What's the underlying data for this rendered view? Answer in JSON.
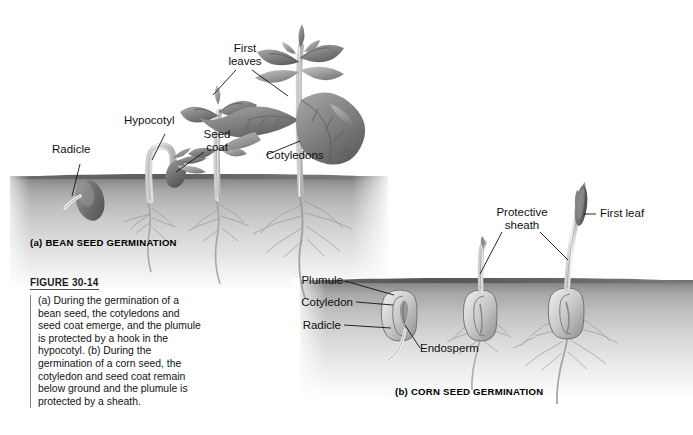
{
  "figure": {
    "number_label": "FIGURE 30-14",
    "caption": "(a) During the germination of a bean seed, the cotyledons and seed coat emerge, and the plumule is protected by a hook in the hypocotyl. (b) During the germination of a corn seed, the cotyledon and seed coat remain below ground and the plumule is protected by a sheath."
  },
  "panel_a": {
    "caption": "(a) BEAN SEED GERMINATION",
    "labels": {
      "radicle": "Radicle",
      "hypocotyl": "Hypocotyl",
      "seed_coat": "Seed\ncoat",
      "first_leaves": "First\nleaves",
      "cotyledons": "Cotyledons"
    }
  },
  "panel_b": {
    "caption": "(b) CORN SEED GERMINATION",
    "labels": {
      "plumule": "Plumule",
      "cotyledon": "Cotyledon",
      "radicle": "Radicle",
      "endosperm": "Endosperm",
      "protective_sheath": "Protective\nsheath",
      "first_leaf": "First leaf"
    }
  },
  "colors": {
    "background": "#ffffff",
    "soil_dark": "#6e6e6e",
    "soil_light": "#ffffff",
    "leader_line": "#1a1a1a",
    "text": "#111111",
    "rule": "#8a8a8a"
  }
}
